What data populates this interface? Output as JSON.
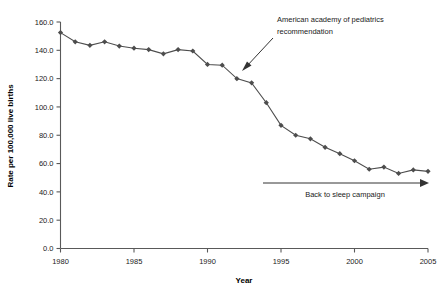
{
  "chart_data": {
    "type": "line",
    "title": "",
    "xlabel": "Year",
    "ylabel": "Rate per 100,000 live births",
    "xlim": [
      1980,
      2005
    ],
    "ylim": [
      0.0,
      160.0
    ],
    "grid": false,
    "legend": "none",
    "x_ticks": [
      "1980",
      "1985",
      "1990",
      "1995",
      "2000",
      "2005"
    ],
    "x_tick_values": [
      1980,
      1985,
      1990,
      1995,
      2000,
      2005
    ],
    "y_ticks": [
      "0.0",
      "20.0",
      "40.0",
      "60.0",
      "80.0",
      "100.0",
      "120.0",
      "140.0",
      "160.0"
    ],
    "y_tick_values": [
      0.0,
      20.0,
      40.0,
      60.0,
      80.0,
      100.0,
      120.0,
      140.0,
      160.0
    ],
    "x": [
      1980,
      1981,
      1982,
      1983,
      1984,
      1985,
      1986,
      1987,
      1988,
      1989,
      1990,
      1991,
      1992,
      1993,
      1994,
      1995,
      1996,
      1997,
      1998,
      1999,
      2000,
      2001,
      2002,
      2003,
      2004,
      2005
    ],
    "values": [
      152.5,
      146.0,
      143.5,
      146.0,
      143.0,
      141.5,
      140.5,
      137.5,
      140.5,
      139.5,
      130.0,
      129.5,
      120.0,
      117.0,
      103.0,
      87.0,
      80.0,
      77.5,
      71.5,
      67.0,
      62.0,
      56.0,
      57.5,
      53.0,
      55.5,
      54.5
    ],
    "series_name": "SIDS rate",
    "marker": "diamond",
    "marker_color": "#4d4d4d",
    "line_color": "#4d4d4d",
    "annotations": [
      {
        "id": "aap",
        "text_line1": "American academy of pediatrics",
        "text_line2": "recommendation",
        "arrow_from": [
          273,
          38
        ],
        "arrow_to": [
          242,
          71
        ]
      },
      {
        "id": "back-to-sleep",
        "text": "Back to sleep campaign",
        "arrow_from": [
          263,
          183
        ],
        "arrow_to": [
          428,
          183
        ]
      }
    ]
  }
}
